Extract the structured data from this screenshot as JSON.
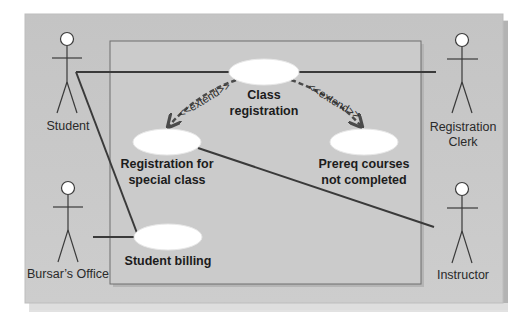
{
  "diagram": {
    "type": "UML use case diagram",
    "colors": {
      "panel": "#c9c9c9",
      "panel_shadow": "#a9a9a9",
      "boundary": "#cfcfcf",
      "boundary_stroke": "#6e6e6e",
      "use_case_fill": "#ffffff",
      "line": "#3a3a3a",
      "extend_line": "#4a4a4a"
    },
    "actors": [
      {
        "id": "student",
        "label": "Student"
      },
      {
        "id": "registration-clerk",
        "label_line1": "Registration",
        "label_line2": "Clerk"
      },
      {
        "id": "bursars-office",
        "label": "Bursar’s Office"
      },
      {
        "id": "instructor",
        "label": "Instructor"
      }
    ],
    "use_cases": [
      {
        "id": "class-registration",
        "label_line1": "Class",
        "label_line2": "registration"
      },
      {
        "id": "registration-special-class",
        "label_line1": "Registration for",
        "label_line2": "special class"
      },
      {
        "id": "prereq-not-completed",
        "label_line1": "Prereq courses",
        "label_line2": "not completed"
      },
      {
        "id": "student-billing",
        "label": "Student billing"
      }
    ],
    "relationships": [
      {
        "from": "student",
        "to": "class-registration",
        "type": "association"
      },
      {
        "from": "registration-clerk",
        "to": "class-registration",
        "type": "association"
      },
      {
        "from": "student",
        "to": "student-billing",
        "type": "association"
      },
      {
        "from": "bursars-office",
        "to": "student-billing",
        "type": "association"
      },
      {
        "from": "instructor",
        "to": "registration-special-class",
        "type": "association"
      },
      {
        "from": "class-registration",
        "to": "registration-special-class",
        "type": "extend",
        "label": "<<extend>>"
      },
      {
        "from": "class-registration",
        "to": "prereq-not-completed",
        "type": "extend",
        "label": "<<extend>>"
      }
    ]
  }
}
